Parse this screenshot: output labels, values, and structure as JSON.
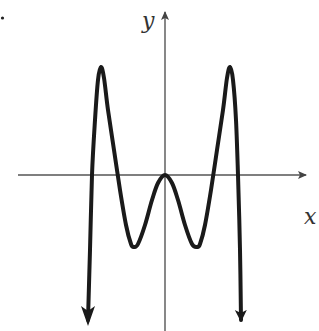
{
  "figure": {
    "type": "function-graph",
    "axes": {
      "x_label": "x",
      "y_label": "y"
    },
    "colors": {
      "curve": "#1a1a1a",
      "axes": "#555555",
      "background": "#ffffff"
    },
    "curve_points_px": [
      [
        88,
        320
      ],
      [
        90,
        250
      ],
      [
        92,
        175
      ],
      [
        95,
        120
      ],
      [
        98,
        80
      ],
      [
        101,
        67
      ],
      [
        104,
        78
      ],
      [
        108,
        110
      ],
      [
        114,
        150
      ],
      [
        120,
        190
      ],
      [
        126,
        225
      ],
      [
        131,
        244
      ],
      [
        134,
        247
      ],
      [
        138,
        244
      ],
      [
        145,
        225
      ],
      [
        152,
        200
      ],
      [
        158,
        183
      ],
      [
        165,
        175
      ],
      [
        172,
        183
      ],
      [
        178,
        200
      ],
      [
        185,
        225
      ],
      [
        192,
        244
      ],
      [
        197,
        247
      ],
      [
        200,
        244
      ],
      [
        205,
        225
      ],
      [
        211,
        190
      ],
      [
        217,
        150
      ],
      [
        223,
        110
      ],
      [
        227,
        78
      ],
      [
        230,
        67
      ],
      [
        233,
        80
      ],
      [
        236,
        120
      ],
      [
        238,
        175
      ],
      [
        240,
        250
      ],
      [
        241,
        320
      ]
    ],
    "key_features": {
      "local_maxima": [
        "left peak",
        "right peak",
        "origin (touching x-axis)"
      ],
      "local_minima": [
        "left trough below x-axis",
        "right trough below x-axis"
      ],
      "x_intercepts": 5,
      "end_behavior": "both ends downward"
    }
  }
}
